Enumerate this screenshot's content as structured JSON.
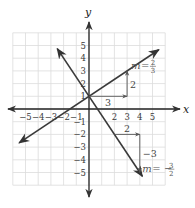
{
  "chart_data": {
    "type": "line",
    "title": "",
    "xlabel": "x",
    "ylabel": "y",
    "xlim": [
      -6,
      6
    ],
    "ylim": [
      -6,
      6
    ],
    "grid": true,
    "x_ticks": [
      "-5",
      "-4",
      "-3",
      "-2",
      "-1",
      "2",
      "3",
      "4",
      "5"
    ],
    "y_ticks": [
      "5",
      "4",
      "3",
      "2",
      "1",
      "-1",
      "-2",
      "-3",
      "-4",
      "-5"
    ],
    "x_tick_values": [
      -5,
      -4,
      -3,
      -2,
      -1,
      2,
      3,
      4,
      5
    ],
    "y_tick_values": [
      5,
      4,
      3,
      2,
      1,
      -1,
      -2,
      -3,
      -4,
      -5
    ],
    "series": [
      {
        "name": "positive-slope-line",
        "slope": 0.6667,
        "y_intercept": 1,
        "x_range": [
          -5.5,
          5.5
        ],
        "slope_label": {
          "prefix": "m =",
          "sign": "",
          "numerator": "2",
          "denominator": "3"
        },
        "run": {
          "label": "3",
          "from": [
            0,
            1
          ],
          "to": [
            3,
            1
          ]
        },
        "rise": {
          "label": "2",
          "from": [
            3,
            1
          ],
          "to": [
            3,
            3
          ]
        }
      },
      {
        "name": "negative-slope-line",
        "slope": -1.5,
        "y_intercept": 1,
        "x_range": [
          -2.5,
          4.2
        ],
        "slope_label": {
          "prefix": "m =",
          "sign": "−",
          "numerator": "3",
          "denominator": "2"
        },
        "run": {
          "label": "2",
          "from": [
            2,
            -2
          ],
          "to": [
            4,
            -2
          ]
        },
        "rise": {
          "label": "−3",
          "from": [
            4,
            -2
          ],
          "to": [
            4,
            -5
          ]
        }
      }
    ]
  }
}
